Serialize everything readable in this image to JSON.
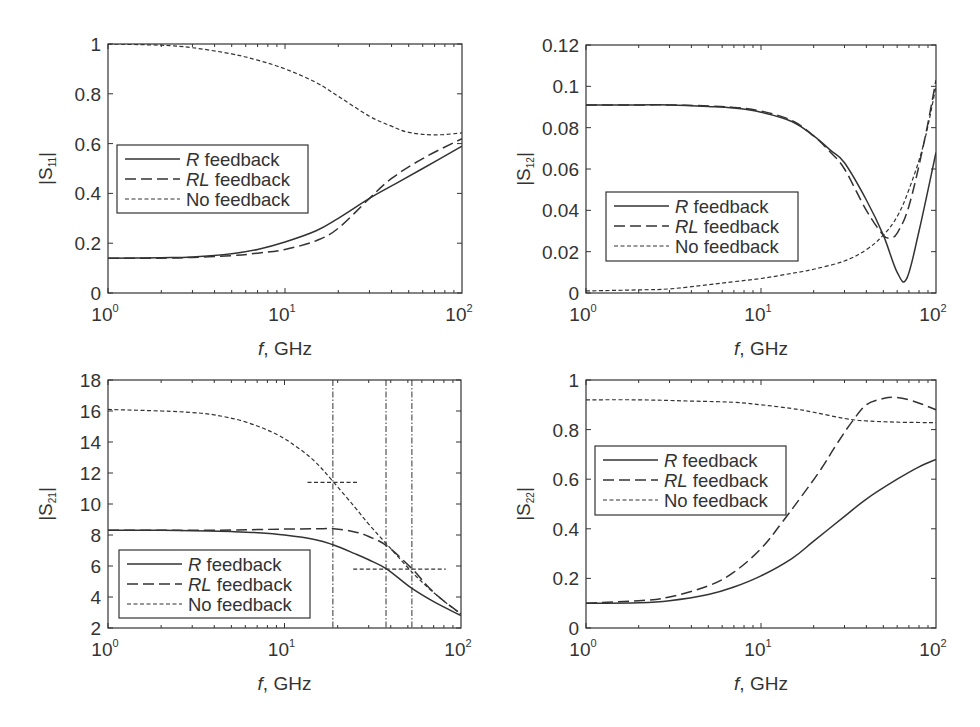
{
  "figure": {
    "legend_labels": [
      {
        "italic": "R",
        "rest": " feedback"
      },
      {
        "italic": "RL",
        "rest": " feedback"
      },
      {
        "italic": "",
        "rest": "No feedback"
      }
    ]
  },
  "chart_data": [
    {
      "type": "line",
      "id": "s11",
      "title": "",
      "xlabel": {
        "italic": "f",
        "rest": ", GHz"
      },
      "ylabel": {
        "base": "|S",
        "sub": "11",
        "end": "|"
      },
      "xscale": "log",
      "xlim": [
        1,
        100
      ],
      "ylim": [
        0,
        1
      ],
      "xticks": [
        {
          "base": "10",
          "exp": "0",
          "value": 1
        },
        {
          "base": "10",
          "exp": "1",
          "value": 10
        },
        {
          "base": "10",
          "exp": "2",
          "value": 100
        }
      ],
      "yticks": [
        {
          "label": "0",
          "value": 0
        },
        {
          "label": "0.2",
          "value": 0.2
        },
        {
          "label": "0.4",
          "value": 0.4
        },
        {
          "label": "0.6",
          "value": 0.6
        },
        {
          "label": "0.8",
          "value": 0.8
        },
        {
          "label": "1",
          "value": 1
        }
      ],
      "grid": false,
      "legend_position": "center-left",
      "series": [
        {
          "name": "R feedback",
          "style": "solid",
          "x": [
            1,
            2,
            3,
            5,
            7,
            10,
            15,
            20,
            30,
            40,
            60,
            100
          ],
          "y": [
            0.14,
            0.142,
            0.145,
            0.158,
            0.175,
            0.205,
            0.25,
            0.3,
            0.38,
            0.43,
            0.5,
            0.59
          ]
        },
        {
          "name": "RL feedback",
          "style": "dashed",
          "x": [
            1,
            2,
            3,
            5,
            7,
            10,
            15,
            20,
            30,
            40,
            60,
            100
          ],
          "y": [
            0.14,
            0.14,
            0.143,
            0.15,
            0.16,
            0.175,
            0.21,
            0.26,
            0.38,
            0.46,
            0.54,
            0.62
          ]
        },
        {
          "name": "No feedback",
          "style": "dotted",
          "x": [
            1,
            2,
            3,
            5,
            7,
            10,
            15,
            20,
            30,
            40,
            50,
            70,
            100
          ],
          "y": [
            1.0,
            0.995,
            0.985,
            0.96,
            0.935,
            0.9,
            0.845,
            0.79,
            0.71,
            0.67,
            0.645,
            0.635,
            0.643
          ]
        }
      ]
    },
    {
      "type": "line",
      "id": "s12",
      "title": "",
      "xlabel": {
        "italic": "f",
        "rest": ", GHz"
      },
      "ylabel": {
        "base": "|S",
        "sub": "12",
        "end": "|"
      },
      "xscale": "log",
      "xlim": [
        1,
        100
      ],
      "ylim": [
        0,
        0.12
      ],
      "xticks": [
        {
          "base": "10",
          "exp": "0",
          "value": 1
        },
        {
          "base": "10",
          "exp": "1",
          "value": 10
        },
        {
          "base": "10",
          "exp": "2",
          "value": 100
        }
      ],
      "yticks": [
        {
          "label": "0",
          "value": 0
        },
        {
          "label": "0.02",
          "value": 0.02
        },
        {
          "label": "0.04",
          "value": 0.04
        },
        {
          "label": "0.06",
          "value": 0.06
        },
        {
          "label": "0.08",
          "value": 0.08
        },
        {
          "label": "0.1",
          "value": 0.1
        },
        {
          "label": "0.12",
          "value": 0.12
        }
      ],
      "grid": false,
      "legend_position": "bottom-left",
      "series": [
        {
          "name": "R feedback",
          "style": "solid",
          "x": [
            1,
            2,
            3,
            5,
            7,
            10,
            15,
            20,
            25,
            30,
            40,
            50,
            60,
            68,
            80,
            100
          ],
          "y": [
            0.091,
            0.091,
            0.091,
            0.0903,
            0.0895,
            0.0875,
            0.083,
            0.076,
            0.069,
            0.063,
            0.045,
            0.028,
            0.01,
            0.007,
            0.03,
            0.068
          ]
        },
        {
          "name": "RL feedback",
          "style": "dashed",
          "x": [
            1,
            2,
            3,
            5,
            7,
            10,
            15,
            20,
            25,
            30,
            40,
            50,
            55,
            60,
            70,
            85,
            100
          ],
          "y": [
            0.091,
            0.091,
            0.091,
            0.0905,
            0.0898,
            0.088,
            0.0835,
            0.076,
            0.068,
            0.06,
            0.04,
            0.028,
            0.027,
            0.029,
            0.042,
            0.072,
            0.103
          ]
        },
        {
          "name": "No feedback",
          "style": "dotted",
          "x": [
            1,
            2,
            3,
            5,
            7,
            10,
            15,
            20,
            30,
            40,
            50,
            60,
            70,
            85,
            100
          ],
          "y": [
            0.001,
            0.0015,
            0.002,
            0.004,
            0.0055,
            0.007,
            0.0095,
            0.0115,
            0.0155,
            0.021,
            0.028,
            0.037,
            0.05,
            0.072,
            0.1
          ]
        }
      ]
    },
    {
      "type": "line",
      "id": "s21",
      "title": "",
      "xlabel": {
        "italic": "f",
        "rest": ", GHz"
      },
      "ylabel": {
        "base": "|S",
        "sub": "21",
        "end": "|"
      },
      "xscale": "log",
      "xlim": [
        1,
        100
      ],
      "ylim": [
        2,
        18
      ],
      "xticks": [
        {
          "base": "10",
          "exp": "0",
          "value": 1
        },
        {
          "base": "10",
          "exp": "1",
          "value": 10
        },
        {
          "base": "10",
          "exp": "2",
          "value": 100
        }
      ],
      "yticks": [
        {
          "label": "2",
          "value": 2
        },
        {
          "label": "4",
          "value": 4
        },
        {
          "label": "6",
          "value": 6
        },
        {
          "label": "8",
          "value": 8
        },
        {
          "label": "10",
          "value": 10
        },
        {
          "label": "12",
          "value": 12
        },
        {
          "label": "14",
          "value": 14
        },
        {
          "label": "16",
          "value": 16
        },
        {
          "label": "18",
          "value": 18
        }
      ],
      "grid": false,
      "legend_position": "bottom-left",
      "series": [
        {
          "name": "R feedback",
          "style": "solid",
          "x": [
            1,
            2,
            3,
            5,
            7,
            10,
            15,
            19,
            25,
            30,
            38,
            52,
            70,
            100
          ],
          "y": [
            8.3,
            8.3,
            8.28,
            8.22,
            8.15,
            8.0,
            7.7,
            7.35,
            6.8,
            6.4,
            5.8,
            4.6,
            3.7,
            2.8
          ]
        },
        {
          "name": "RL feedback",
          "style": "dashed",
          "x": [
            1,
            2,
            3,
            5,
            7,
            10,
            15,
            19,
            25,
            30,
            38,
            53,
            70,
            100
          ],
          "y": [
            8.3,
            8.3,
            8.3,
            8.32,
            8.35,
            8.38,
            8.4,
            8.4,
            8.2,
            7.9,
            7.3,
            5.8,
            4.3,
            2.9
          ]
        },
        {
          "name": "No feedback",
          "style": "dotted",
          "x": [
            1,
            2,
            3,
            4,
            6,
            9,
            12,
            15,
            19,
            25,
            30,
            38,
            55,
            75,
            100
          ],
          "y": [
            16.1,
            16.0,
            15.9,
            15.75,
            15.3,
            14.5,
            13.6,
            12.7,
            11.4,
            9.8,
            8.7,
            7.4,
            5.4,
            4.0,
            2.9
          ]
        }
      ],
      "reference_lines": {
        "vertical": [
          {
            "x": 18.8,
            "style": "dash-dot"
          },
          {
            "x": 37.6,
            "style": "dash-dot"
          },
          {
            "x": 52.7,
            "style": "dash-dot"
          }
        ],
        "horizontal": [
          {
            "y": 11.4,
            "x_from": 13.5,
            "x_to": 26.5,
            "style": "dotted"
          },
          {
            "y": 5.8,
            "x_from": 24.5,
            "x_to": 82,
            "style": "dotted"
          }
        ]
      }
    },
    {
      "type": "line",
      "id": "s22",
      "title": "",
      "xlabel": {
        "italic": "f",
        "rest": ", GHz"
      },
      "ylabel": {
        "base": "|S",
        "sub": "22",
        "end": "|"
      },
      "xscale": "log",
      "xlim": [
        1,
        100
      ],
      "ylim": [
        0,
        1
      ],
      "xticks": [
        {
          "base": "10",
          "exp": "0",
          "value": 1
        },
        {
          "base": "10",
          "exp": "1",
          "value": 10
        },
        {
          "base": "10",
          "exp": "2",
          "value": 100
        }
      ],
      "yticks": [
        {
          "label": "0",
          "value": 0
        },
        {
          "label": "0.2",
          "value": 0.2
        },
        {
          "label": "0.4",
          "value": 0.4
        },
        {
          "label": "0.6",
          "value": 0.6
        },
        {
          "label": "0.8",
          "value": 0.8
        },
        {
          "label": "1",
          "value": 1
        }
      ],
      "grid": false,
      "legend_position": "center-left",
      "series": [
        {
          "name": "R feedback",
          "style": "solid",
          "x": [
            1,
            2,
            3,
            5,
            7,
            10,
            15,
            20,
            30,
            40,
            60,
            80,
            100
          ],
          "y": [
            0.1,
            0.102,
            0.11,
            0.135,
            0.165,
            0.21,
            0.28,
            0.35,
            0.45,
            0.52,
            0.6,
            0.65,
            0.68
          ]
        },
        {
          "name": "RL feedback",
          "style": "dashed",
          "x": [
            1,
            2,
            3,
            5,
            7,
            10,
            13,
            17,
            22,
            27,
            33,
            40,
            50,
            58,
            70,
            85,
            100
          ],
          "y": [
            0.1,
            0.11,
            0.125,
            0.17,
            0.225,
            0.32,
            0.42,
            0.53,
            0.64,
            0.74,
            0.83,
            0.9,
            0.925,
            0.93,
            0.92,
            0.9,
            0.88
          ]
        },
        {
          "name": "No feedback",
          "style": "dotted",
          "x": [
            1,
            2,
            4,
            7,
            10,
            15,
            20,
            30,
            40,
            60,
            100
          ],
          "y": [
            0.92,
            0.92,
            0.915,
            0.91,
            0.9,
            0.885,
            0.87,
            0.845,
            0.835,
            0.83,
            0.828
          ]
        }
      ]
    }
  ]
}
